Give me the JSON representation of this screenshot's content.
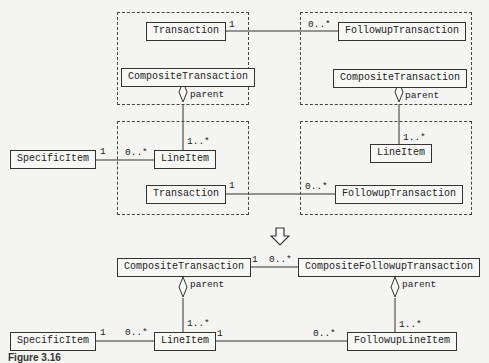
{
  "top_diagram": {
    "packages": [
      {
        "id": "pkg-top-left"
      },
      {
        "id": "pkg-top-right"
      },
      {
        "id": "pkg-mid-left"
      },
      {
        "id": "pkg-mid-right"
      }
    ],
    "classes": {
      "transaction_top": "Transaction",
      "followup_top": "FollowupTransaction",
      "composite_left": "CompositeTransaction",
      "composite_right": "CompositeTransaction",
      "specific_item": "SpecificItem",
      "lineitem_left": "LineItem",
      "lineitem_right": "LineItem",
      "transaction_mid": "Transaction",
      "followup_mid": "FollowupTransaction"
    },
    "labels": {
      "t_top_mult": "1",
      "f_top_mult": "0..*",
      "parent_left": "parent",
      "parent_right": "parent",
      "li_left_mult": "1..*",
      "li_right_mult": "1..*",
      "si_mult": "1",
      "li_si_mult": "0..*",
      "t_mid_mult": "1",
      "f_mid_mult": "0..*"
    }
  },
  "arrow": {
    "icon": "down-arrow-icon"
  },
  "bottom_diagram": {
    "classes": {
      "composite": "CompositeTransaction",
      "composite_followup": "CompositeFollowupTransaction",
      "specific_item": "SpecificItem",
      "lineitem": "LineItem",
      "followup_lineitem": "FollowupLineItem"
    },
    "labels": {
      "ct_mult": "1",
      "cft_mult": "0..*",
      "parent_left": "parent",
      "parent_right": "parent",
      "li_mult": "1..*",
      "fli_mult": "1..*",
      "si_mult": "1",
      "li_si_mult": "0..*",
      "li_fli_mult": "1",
      "fli_li_mult": "0..*"
    }
  },
  "caption": "Figure 3.16"
}
